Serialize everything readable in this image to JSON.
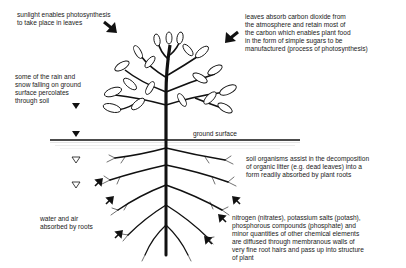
{
  "diagram": {
    "labels": {
      "sunlight": "sunlight enables photosynthesis\nto take place in leaves",
      "leaves": "leaves absorb carbon dioxide from\nthe atmosphere and retain most of\nthe carbon which enables plant food\nin the form of simple sugars to be\nmanufactured (process of photosynthesis)",
      "rain": "some of the rain and\nsnow falling on ground\nsurface percolates\nthrough soil",
      "ground": "ground surface",
      "soil_organisms": "soil organisms assist in the decomposition\nof organic litter (e.g. dead leaves) into a\nform readily absorbed by plant roots",
      "water_air": "water and air\nabsorbed by roots",
      "nutrients": "nitrogen (nitrates), potassium salts (potash),\nphosphorous compounds (phosphate) and\nminor quantities of other chemical elements\nare diffused through membranous walls of\nvery fine root hairs and pass up into structure\nof plant"
    },
    "icons": {
      "sun_arrow": "arrow-down-right-icon",
      "co2_arrow": "arrow-down-left-icon",
      "rain_markers": "triangle-down-icon",
      "water_arrows": "arrow-up-right-icon",
      "nutrient_arrows": "arrow-up-left-icon"
    },
    "colors": {
      "ink": "#111111",
      "paper": "#ffffff"
    }
  }
}
